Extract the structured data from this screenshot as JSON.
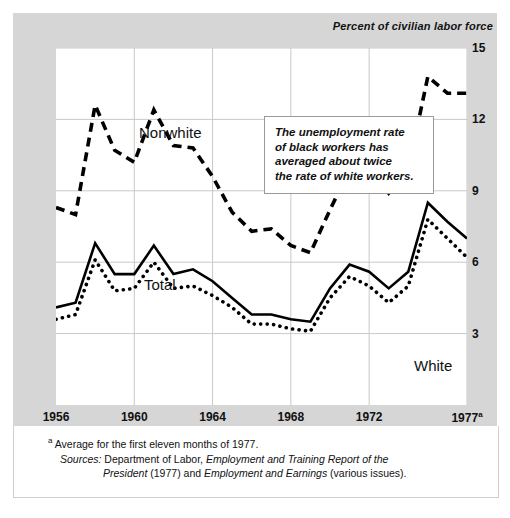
{
  "axis_title": "Percent of civilian labor force",
  "callout": {
    "text": "The unemployment rate\nof black workers has\naveraged about twice\nthe rate of white workers."
  },
  "footnotes": {
    "marker": "a",
    "note": "Average for the first eleven months of 1977.",
    "sources_label": "Sources:",
    "sources_line1_pre": "Department of Labor, ",
    "sources_line1_italic": "Employment and Training Report of the",
    "sources_line2_italic_a": "President",
    "sources_line2_mid": " (1977) and ",
    "sources_line2_italic_b": "Employment and Earnings",
    "sources_line2_post": " (various issues)."
  },
  "series_labels": {
    "nonwhite": "Nonwhite",
    "total": "Total",
    "white": "White"
  },
  "chart_data": {
    "type": "line",
    "title": "",
    "subtitle": "",
    "xlabel": "",
    "ylabel": "Percent of civilian labor force",
    "xlim": [
      1956,
      1977
    ],
    "ylim": [
      0,
      15
    ],
    "yticks": [
      15,
      12,
      9,
      6,
      3
    ],
    "xticks": [
      1956,
      1960,
      1964,
      1968,
      1972,
      1977
    ],
    "xtick_labels": [
      "1956",
      "1960",
      "1964",
      "1968",
      "1972",
      "1977a"
    ],
    "grid": true,
    "grid_axis": "both",
    "legend": "inline-labels",
    "x": [
      1956,
      1957,
      1958,
      1959,
      1960,
      1961,
      1962,
      1963,
      1964,
      1965,
      1966,
      1967,
      1968,
      1969,
      1970,
      1971,
      1972,
      1973,
      1974,
      1975,
      1976,
      1977
    ],
    "series": [
      {
        "name": "Nonwhite",
        "style": "dashed",
        "color": "#000000",
        "values": [
          8.3,
          8.0,
          12.6,
          10.7,
          10.2,
          12.4,
          10.9,
          10.8,
          9.6,
          8.1,
          7.3,
          7.4,
          6.7,
          6.4,
          8.2,
          9.9,
          10.0,
          8.9,
          9.9,
          13.8,
          13.1,
          13.1
        ]
      },
      {
        "name": "Total",
        "style": "solid",
        "color": "#000000",
        "values": [
          4.1,
          4.3,
          6.8,
          5.5,
          5.5,
          6.7,
          5.5,
          5.7,
          5.2,
          4.5,
          3.8,
          3.8,
          3.6,
          3.5,
          4.9,
          5.9,
          5.6,
          4.9,
          5.6,
          8.5,
          7.7,
          7.0
        ]
      },
      {
        "name": "White",
        "style": "dotted",
        "color": "#000000",
        "values": [
          3.6,
          3.8,
          6.1,
          4.8,
          4.9,
          6.0,
          4.9,
          5.0,
          4.6,
          4.1,
          3.4,
          3.4,
          3.2,
          3.1,
          4.5,
          5.4,
          5.0,
          4.3,
          5.0,
          7.8,
          7.0,
          6.2
        ]
      }
    ]
  }
}
